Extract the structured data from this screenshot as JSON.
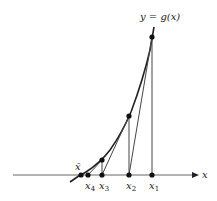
{
  "figure": {
    "curve_label": "y = g(x)",
    "axis_label": "x",
    "points": [
      {
        "label": "x̄",
        "sub": "",
        "x": 81
      },
      {
        "label": "x",
        "sub": "4",
        "x": 88
      },
      {
        "label": "x",
        "sub": "3",
        "x": 102
      },
      {
        "label": "x",
        "sub": "2",
        "x": 129
      },
      {
        "label": "x",
        "sub": "1",
        "x": 152
      }
    ],
    "colors": {
      "line": "#222222",
      "axis": "#555555"
    }
  }
}
